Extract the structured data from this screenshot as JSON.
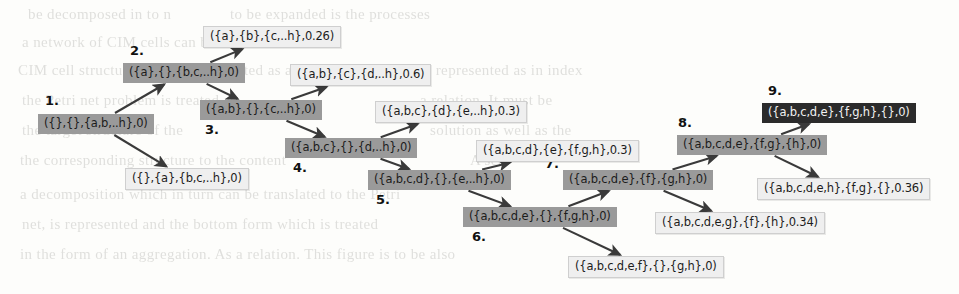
{
  "figure": {
    "type": "search-tree-diagram",
    "background_note": "scanned book page with faint bleed-through text"
  },
  "colors": {
    "node_visited": "#9a9a9a",
    "node_frontier": "#efefef",
    "node_goal": "#2b2b2b",
    "arrow": "#3a3a3a",
    "page_background": "#fdfdfb"
  },
  "nodes": [
    {
      "id": "n1",
      "number": "1.",
      "label": "({},{},{a,b,..h},0)",
      "style": "dark",
      "x": 38,
      "y": 114,
      "num_x": 45,
      "num_y": 93
    },
    {
      "id": "n2",
      "number": "2.",
      "label": "({a},{},{b,c,..h},0)",
      "style": "dark",
      "x": 123,
      "y": 63,
      "num_x": 130,
      "num_y": 43
    },
    {
      "id": "n3",
      "number": "3.",
      "label": "({a,b},{},{c,..h},0)",
      "style": "dark",
      "x": 200,
      "y": 100,
      "num_x": 205,
      "num_y": 122
    },
    {
      "id": "n4",
      "number": "4.",
      "label": "({a,b,c},{},{d,..h},0)",
      "style": "dark",
      "x": 285,
      "y": 138,
      "num_x": 293,
      "num_y": 160
    },
    {
      "id": "n5",
      "number": "5.",
      "label": "({a,b,c,d},{},{e,..h},0)",
      "style": "dark",
      "x": 368,
      "y": 170,
      "num_x": 376,
      "num_y": 192
    },
    {
      "id": "n6",
      "number": "6.",
      "label": "({a,b,c,d,e},{},{f,g,h},0)",
      "style": "dark",
      "x": 463,
      "y": 207,
      "num_x": 472,
      "num_y": 229
    },
    {
      "id": "n7",
      "number": "7.",
      "label": "({a,b,c,d,e},{f},{g,h},0)",
      "style": "dark",
      "x": 563,
      "y": 170,
      "num_x": 545,
      "num_y": 156
    },
    {
      "id": "n8",
      "number": "8.",
      "label": "({a,b,c,d,e},{f,g},{h},0)",
      "style": "dark",
      "x": 677,
      "y": 135,
      "num_x": 678,
      "num_y": 115
    },
    {
      "id": "n9",
      "number": "9.",
      "label": "({a,b,c,d,e},{f,g,h},{},0)",
      "style": "dark-strong",
      "x": 762,
      "y": 103,
      "num_x": 768,
      "num_y": 83
    }
  ],
  "leaves": [
    {
      "id": "l1",
      "label": "({a},{b},{c,..h},0.26)",
      "style": "light",
      "x": 203,
      "y": 26
    },
    {
      "id": "l2",
      "label": "({},{a},{b,c,..h},0)",
      "style": "light",
      "x": 125,
      "y": 168
    },
    {
      "id": "l3",
      "label": "({a,b},{c},{d,..h},0.6)",
      "style": "light",
      "x": 290,
      "y": 64
    },
    {
      "id": "l4",
      "label": "({a,b,c},{d},{e,..h},0.3)",
      "style": "light",
      "x": 375,
      "y": 101
    },
    {
      "id": "l5",
      "label": "({a,b,c,d},{e},{f,g,h},0.3)",
      "style": "light",
      "x": 476,
      "y": 140
    },
    {
      "id": "l6",
      "label": "({a,b,c,d,e,f},{},{g,h},0)",
      "style": "light",
      "x": 568,
      "y": 256
    },
    {
      "id": "l7",
      "label": "({a,b,c,d,e,g},{f},{h},0.34)",
      "style": "light",
      "x": 655,
      "y": 212
    },
    {
      "id": "l8",
      "label": "({a,b,c,d,e,h},{f,g},{},0.36)",
      "style": "light",
      "x": 757,
      "y": 178
    }
  ],
  "edges": [
    {
      "from": "n1",
      "to": "n2",
      "label": ""
    },
    {
      "from": "n1",
      "to": "l2",
      "label": ""
    },
    {
      "from": "n2",
      "to": "l1",
      "label": ""
    },
    {
      "from": "n2",
      "to": "n3",
      "label": ""
    },
    {
      "from": "n3",
      "to": "l3",
      "label": ""
    },
    {
      "from": "n3",
      "to": "n4",
      "label": ""
    },
    {
      "from": "n4",
      "to": "l4",
      "label": ""
    },
    {
      "from": "n4",
      "to": "n5",
      "label": ""
    },
    {
      "from": "n5",
      "to": "l5",
      "label": ""
    },
    {
      "from": "n5",
      "to": "n6",
      "label": ""
    },
    {
      "from": "n6",
      "to": "n7",
      "label": ""
    },
    {
      "from": "n6",
      "to": "l6",
      "label": ""
    },
    {
      "from": "n7",
      "to": "n8",
      "label": ""
    },
    {
      "from": "n7",
      "to": "l7",
      "label": ""
    },
    {
      "from": "n8",
      "to": "n9",
      "label": ""
    },
    {
      "from": "n8",
      "to": "l8",
      "label": ""
    }
  ],
  "bleed_text": [
    {
      "t": "be decomposed in to n",
      "x": 28,
      "y": 6
    },
    {
      "t": "to be expanded is the processes",
      "x": 230,
      "y": 6
    },
    {
      "t": "a network of CIM cells can be represented",
      "x": 22,
      "y": 34
    },
    {
      "t": "CIM cell structure is to be represented as a",
      "x": 18,
      "y": 62
    },
    {
      "t": "to be represented as in index",
      "x": 400,
      "y": 62
    },
    {
      "t": "the Petri net problem is treated as",
      "x": 22,
      "y": 92
    },
    {
      "t": "a relation. It must be",
      "x": 420,
      "y": 92
    },
    {
      "t": "the target structure of the",
      "x": 22,
      "y": 122
    },
    {
      "t": "solution as well as the",
      "x": 430,
      "y": 122
    },
    {
      "t": "the corresponding structure to the content",
      "x": 20,
      "y": 152
    },
    {
      "t": "A set",
      "x": 470,
      "y": 152
    },
    {
      "t": "a decomposition which in turn can be translated to the Petri",
      "x": 20,
      "y": 186
    },
    {
      "t": "net, is represented and the bottom form which is treated",
      "x": 22,
      "y": 216
    },
    {
      "t": "in the form of an aggregation. As a relation. This figure is to be also",
      "x": 20,
      "y": 246
    }
  ]
}
